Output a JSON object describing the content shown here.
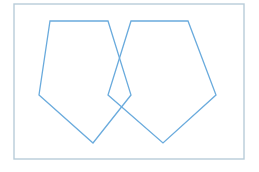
{
  "canvas": {
    "width": 259,
    "height": 172,
    "background_color": "#ffffff",
    "title": "Two overlapping pentagons"
  },
  "frame": {
    "label": "border-frame",
    "x": 14,
    "y": 4,
    "width": 230,
    "height": 155,
    "stroke_color": "#b8ccd9",
    "stroke_width": 1.4,
    "fill": "none"
  },
  "shapes": {
    "stroke_color": "#6aabdd",
    "stroke_width": 1.3,
    "fill": "none",
    "items": [
      {
        "name": "left-pentagon",
        "label": "Left pentagon",
        "points": "50,21 108,21 131,95 93,143 39,95",
        "vertices": [
          {
            "label": "top-left",
            "x": 50,
            "y": 21
          },
          {
            "label": "top-right",
            "x": 108,
            "y": 21
          },
          {
            "label": "right",
            "x": 131,
            "y": 95
          },
          {
            "label": "bottom",
            "x": 93,
            "y": 143
          },
          {
            "label": "left",
            "x": 39,
            "y": 95
          }
        ]
      },
      {
        "name": "right-pentagon",
        "label": "Right pentagon",
        "points": "131,21 188,21 216,95 163,143 108,95",
        "vertices": [
          {
            "label": "top-left",
            "x": 131,
            "y": 21
          },
          {
            "label": "top-right",
            "x": 188,
            "y": 21
          },
          {
            "label": "right",
            "x": 216,
            "y": 95
          },
          {
            "label": "bottom",
            "x": 163,
            "y": 143
          },
          {
            "label": "left",
            "x": 108,
            "y": 95
          }
        ]
      }
    ]
  },
  "intersections": [
    {
      "name": "upper-crossing",
      "x": 120,
      "y": 42
    },
    {
      "name": "lower-crossing",
      "x": 120,
      "y": 91
    }
  ]
}
